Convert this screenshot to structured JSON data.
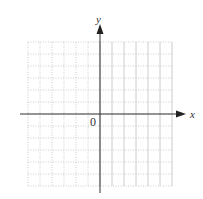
{
  "chart_data": {
    "type": "grid",
    "title": "",
    "xlabel": "x",
    "ylabel": "y",
    "origin_label": "0",
    "grid": true,
    "xlim": [
      -6,
      6
    ],
    "ylim": [
      -6,
      6
    ],
    "series": []
  },
  "graph": {
    "x_axis_label": "x",
    "y_axis_label": "y",
    "origin_label": "0",
    "grid_color": "#bfbfbf",
    "axis_color": "#333333"
  }
}
